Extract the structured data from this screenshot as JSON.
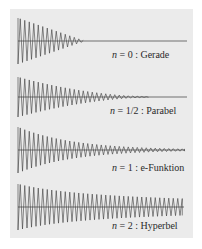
{
  "figure": {
    "background": "#ebebeb",
    "stroke_color": "#3a3a3a",
    "panels": [
      {
        "id": "gerade",
        "n_symbol": "n",
        "n_value": "= 0",
        "name": ": Gerade",
        "label_pos": [
          112,
          50
        ],
        "x_start": 18,
        "x_end": 187,
        "x_converge": 85,
        "center_y": 41,
        "amplitude": 23,
        "envelope": "linear"
      },
      {
        "id": "parabel",
        "n_symbol": "n",
        "n_value": "= 1/2",
        "name": ": Parabel",
        "label_pos": [
          110,
          106
        ],
        "x_start": 18,
        "x_end": 187,
        "x_converge": 165,
        "center_y": 97,
        "amplitude": 20,
        "envelope": "parabola"
      },
      {
        "id": "e-funktion",
        "n_symbol": "n",
        "n_value": "= 1",
        "name": ": e-Funktion",
        "label_pos": [
          112,
          163
        ],
        "x_start": 18,
        "x_end": 185,
        "x_converge": null,
        "center_y": 150,
        "amplitude": 23,
        "envelope": "exponential"
      },
      {
        "id": "hyperbel",
        "n_symbol": "n",
        "n_value": "= 2",
        "name": ": Hyperbel",
        "label_pos": [
          112,
          221
        ],
        "x_start": 18,
        "x_end": 184,
        "x_converge": null,
        "center_y": 207,
        "amplitude": 23,
        "envelope": "hyperbola"
      }
    ]
  }
}
